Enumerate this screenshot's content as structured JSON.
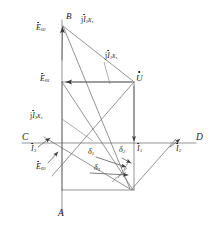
{
  "figure": {
    "type": "phasor-diagram",
    "background_color": "#ffffff",
    "line_color": "#555555",
    "text_color": "#1a1a1a",
    "width": 216,
    "height": 232
  },
  "axes": {
    "horizontal": {
      "left_label": "C",
      "right_label": "D",
      "y": 143
    },
    "vertical": {
      "bottom_label": "A",
      "top_label": "B",
      "x": 62
    }
  },
  "labels": {
    "point_b": "B",
    "axis_c": "C",
    "axis_d": "D",
    "axis_a": "A",
    "e02": {
      "base": "E",
      "sub": "02"
    },
    "e01": {
      "base": "E",
      "sub": "01"
    },
    "e03": {
      "base": "E",
      "sub": "03"
    },
    "u": {
      "base": "U"
    },
    "jI2xs": {
      "pre": "j",
      "base": "I",
      "sub": "2",
      "tail": "x",
      "tailsub": "s"
    },
    "jI1xs": {
      "pre": "j",
      "base": "I",
      "sub": "1",
      "tail": "x",
      "tailsub": "s"
    },
    "jI3xs": {
      "pre": "j",
      "base": "I",
      "sub": "3",
      "tail": "x",
      "tailsub": "s"
    },
    "i1": {
      "base": "I",
      "sub": "1"
    },
    "i2": {
      "base": "I",
      "sub": "2"
    },
    "i3": {
      "base": "I",
      "sub": "3"
    },
    "delta1": {
      "base": "δ",
      "sub": "1"
    },
    "delta2": {
      "base": "δ",
      "sub": "2"
    },
    "delta3": {
      "base": "δ",
      "sub": "3"
    }
  }
}
